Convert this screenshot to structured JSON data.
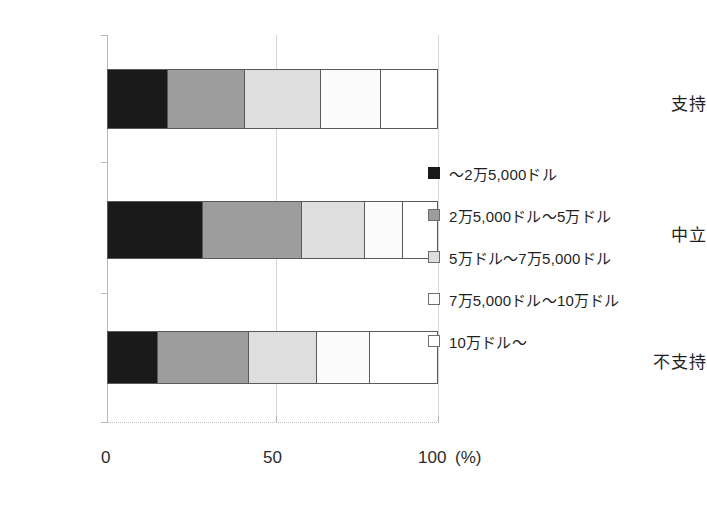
{
  "chart_data": {
    "type": "bar",
    "orientation": "horizontal",
    "stacked": true,
    "normalized_percent": true,
    "title": "",
    "xlabel": "",
    "ylabel": "",
    "unit_label": "(%)",
    "xlim": [
      0,
      100
    ],
    "xticks": [
      0,
      50,
      100
    ],
    "xtick_labels": [
      "0",
      "50",
      "100"
    ],
    "grid": true,
    "legend_position": "right",
    "categories": [
      "支持",
      "中立",
      "不支持"
    ],
    "series": [
      {
        "name": "～2万5,000ドル",
        "color": "#1a1a1a",
        "values": [
          18.1,
          28.7,
          15.1
        ]
      },
      {
        "name": "2万5,000ドル～5万ドル",
        "color": "#9d9d9d",
        "values": [
          23.5,
          30.1,
          27.8
        ]
      },
      {
        "name": "5万ドル～7万5,000ドル",
        "color": "#dedede",
        "values": [
          22.9,
          19.3,
          20.5
        ]
      },
      {
        "name": "7万5,000ドル～10万ドル",
        "color": "#fbfbfb",
        "values": [
          18.4,
          11.5,
          16.3
        ]
      },
      {
        "name": "10万ドル～",
        "color": "#ffffff",
        "values": [
          16.9,
          10.3,
          20.3
        ]
      }
    ]
  },
  "axis": {
    "xticks": [
      {
        "label": "0",
        "value": 0
      },
      {
        "label": "50",
        "value": 50
      },
      {
        "label": "100",
        "value": 100
      }
    ],
    "unit": "(%)"
  },
  "categories": [
    {
      "label": "支持"
    },
    {
      "label": "中立"
    },
    {
      "label": "不支持"
    }
  ],
  "legend": {
    "items": [
      {
        "label": "～2万5,000ドル",
        "swatch": "black"
      },
      {
        "label": "2万5,000ドル～5万ドル",
        "swatch": "gray"
      },
      {
        "label": "5万ドル～7万5,000ドル",
        "swatch": "light-gray"
      },
      {
        "label": "7万5,000ドル～10万ドル",
        "swatch": "white"
      },
      {
        "label": "10万ドル～",
        "swatch": "white"
      }
    ]
  }
}
